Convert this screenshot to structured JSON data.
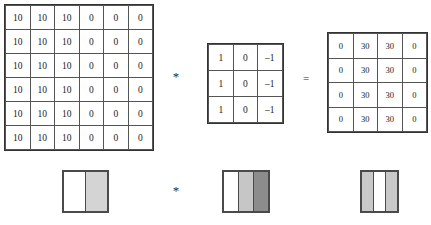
{
  "figure": {
    "operators": {
      "convolution_top": "*",
      "equals_top": "=",
      "convolution_bottom": "*"
    }
  },
  "matrices": {
    "input": {
      "name": "input-image-matrix",
      "rows": 6,
      "cols": 6,
      "values": [
        [
          "10",
          "10",
          "10",
          "0",
          "0",
          "0"
        ],
        [
          "10",
          "10",
          "10",
          "0",
          "0",
          "0"
        ],
        [
          "10",
          "10",
          "10",
          "0",
          "0",
          "0"
        ],
        [
          "10",
          "10",
          "10",
          "0",
          "0",
          "0"
        ],
        [
          "10",
          "10",
          "10",
          "0",
          "0",
          "0"
        ],
        [
          "10",
          "10",
          "10",
          "0",
          "0",
          "0"
        ]
      ]
    },
    "kernel": {
      "name": "filter-kernel-matrix",
      "rows": 3,
      "cols": 3,
      "values": [
        [
          "1",
          "0",
          "–1"
        ],
        [
          "1",
          "0",
          "–1"
        ],
        [
          "1",
          "0",
          "–1"
        ]
      ]
    },
    "output": {
      "name": "output-feature-map-matrix",
      "rows": 4,
      "cols": 4,
      "values": [
        [
          "0",
          "30",
          "30",
          "0"
        ],
        [
          "0",
          "30",
          "30",
          "0"
        ],
        [
          "0",
          "30",
          "30",
          "0"
        ],
        [
          "0",
          "30",
          "30",
          "0"
        ]
      ]
    }
  },
  "images": {
    "input": {
      "name": "input-image-visual",
      "bands": [
        {
          "label": "bright-left-half",
          "color": "#ffffff",
          "flex": 1
        },
        {
          "label": "gray-right-half",
          "color": "#d4d4d4",
          "flex": 1
        }
      ]
    },
    "kernel": {
      "name": "kernel-visual",
      "bands": [
        {
          "label": "white-band",
          "color": "#ffffff",
          "flex": 1
        },
        {
          "label": "light-gray-band",
          "color": "#c6c6c6",
          "flex": 1
        },
        {
          "label": "dark-gray-band",
          "color": "#8c8c8c",
          "flex": 1
        }
      ]
    },
    "output": {
      "name": "output-image-visual",
      "bands": [
        {
          "label": "light-gray-band",
          "color": "#c9c9c9",
          "flex": 1
        },
        {
          "label": "white-band",
          "color": "#ffffff",
          "flex": 1
        },
        {
          "label": "light-gray-band",
          "color": "#c9c9c9",
          "flex": 1
        }
      ]
    }
  },
  "colors": {
    "grid_line": "#555555",
    "figure_border": "#4a4a4a",
    "text": "#1a1a1a",
    "background": "#ffffff"
  }
}
